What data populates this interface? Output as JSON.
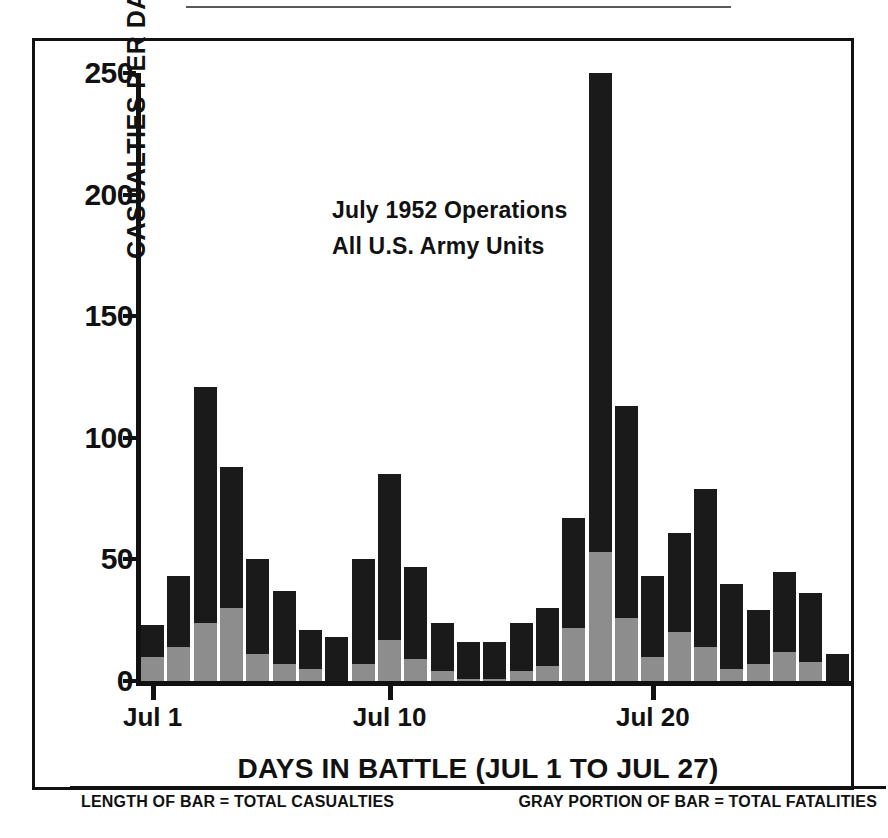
{
  "figure": {
    "annotation_line1": "July  1952 Operations",
    "annotation_line2": "All U.S. Army Units",
    "xaxis_title": "DAYS IN BATTLE (JUL 1 TO JUL 27)",
    "yaxis_title": "CASUALTIES PER DAY",
    "footer_left": "LENGTH OF BAR = TOTAL CASUALTIES",
    "footer_right": "GRAY PORTION OF BAR = TOTAL FATALITIES"
  },
  "colors": {
    "bar_total": "#1a1a1a",
    "bar_gray": "#8d8d8d",
    "axis": "#111111",
    "background": "#ffffff"
  },
  "chart_data": {
    "type": "bar",
    "xlabel": "DAYS IN BATTLE (JUL 1 TO JUL 27)",
    "ylabel": "CASUALTIES PER DAY",
    "ylim": [
      0,
      250
    ],
    "yticks": [
      0,
      50,
      100,
      150,
      200,
      250
    ],
    "ytick_labels": [
      "0",
      "50",
      "100",
      "150",
      "200",
      "250"
    ],
    "grid": false,
    "legend_position": "footer",
    "stacked": true,
    "categories": [
      "Jul 1",
      "Jul 2",
      "Jul 3",
      "Jul 4",
      "Jul 5",
      "Jul 6",
      "Jul 7",
      "Jul 8",
      "Jul 9",
      "Jul 10",
      "Jul 11",
      "Jul 12",
      "Jul 13",
      "Jul 14",
      "Jul 15",
      "Jul 16",
      "Jul 17",
      "Jul 18",
      "Jul 19",
      "Jul 20",
      "Jul 21",
      "Jul 22",
      "Jul 23",
      "Jul 24",
      "Jul 25",
      "Jul 26",
      "Jul 27"
    ],
    "xtick_positions": [
      "Jul 1",
      "Jul 10",
      "Jul 20"
    ],
    "xtick_labels": [
      "Jul 1",
      "Jul 10",
      "Jul 20"
    ],
    "series": [
      {
        "name": "Total casualties",
        "color": "#1a1a1a",
        "values": [
          23,
          43,
          121,
          88,
          50,
          37,
          21,
          18,
          50,
          85,
          47,
          24,
          16,
          16,
          24,
          30,
          67,
          250,
          113,
          43,
          61,
          79,
          40,
          29,
          45,
          36,
          11
        ]
      },
      {
        "name": "Total fatalities",
        "color": "#8d8d8d",
        "values": [
          10,
          14,
          24,
          30,
          11,
          7,
          5,
          0,
          7,
          17,
          9,
          4,
          1,
          1,
          4,
          6,
          22,
          53,
          26,
          10,
          20,
          14,
          5,
          7,
          12,
          8,
          0
        ]
      }
    ]
  }
}
